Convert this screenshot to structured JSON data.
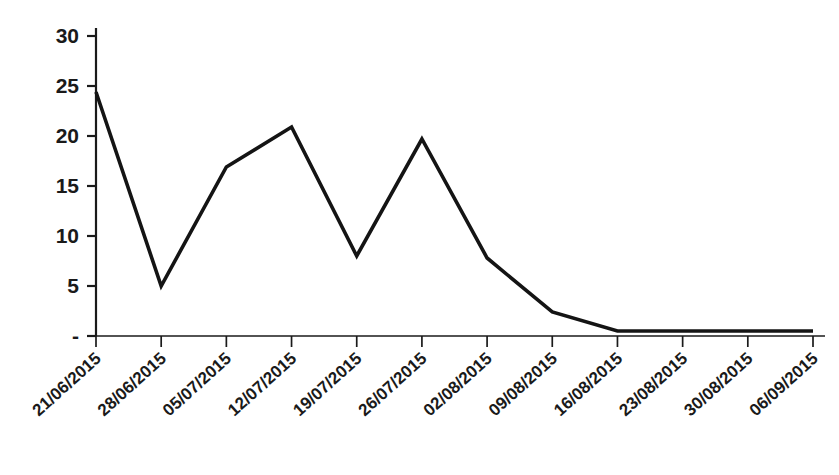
{
  "chart_data": {
    "type": "line",
    "title": "",
    "subtitle": "",
    "xlabel": "",
    "ylabel": "",
    "categories": [
      "21/06/2015",
      "28/06/2015",
      "05/07/2015",
      "12/07/2015",
      "19/07/2015",
      "26/07/2015",
      "02/08/2015",
      "09/08/2015",
      "16/08/2015",
      "23/08/2015",
      "30/08/2015",
      "06/09/2015"
    ],
    "values": [
      24.4,
      5.0,
      16.9,
      20.9,
      8.0,
      19.7,
      7.8,
      2.4,
      0.5,
      0.5,
      0.5,
      0.5
    ],
    "series": [
      {
        "name": "",
        "values": [
          24.4,
          5.0,
          16.9,
          20.9,
          8.0,
          19.7,
          7.8,
          2.4,
          0.5,
          0.5,
          0.5,
          0.5
        ],
        "color": "#141414"
      }
    ],
    "ylim": [
      0,
      30
    ],
    "yticks": [
      0,
      5,
      10,
      15,
      20,
      25,
      30
    ],
    "ytick_labels": [
      "-",
      "5",
      "10",
      "15",
      "20",
      "25",
      "30"
    ],
    "grid": false,
    "legend": false,
    "legend_position": "none",
    "annotations": []
  },
  "colors": {
    "line": "#141414",
    "axis": "#1a1a1a",
    "text": "#1a1a1a",
    "background": "#ffffff"
  }
}
